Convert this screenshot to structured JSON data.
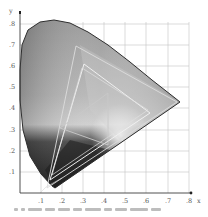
{
  "diagram": {
    "type": "CIE 1931 xy chromaticity diagram (grayscale) with gamut triangles",
    "axes": {
      "x_label": "x",
      "y_label": "y",
      "x_ticks": [
        ".1",
        ".2",
        ".3",
        ".4",
        ".5",
        ".6",
        ".7",
        ".8"
      ],
      "y_ticks": [
        ".1",
        ".2",
        ".3",
        ".4",
        ".5",
        ".6",
        ".7",
        ".8"
      ]
    },
    "caption_visible_but_illegible": true
  },
  "colors": {
    "background": "#ffffff",
    "grid": "#bdbdbd",
    "axis": "#444444",
    "locus_outline": "#333333",
    "gamut_lines": "#e8e8e8"
  }
}
